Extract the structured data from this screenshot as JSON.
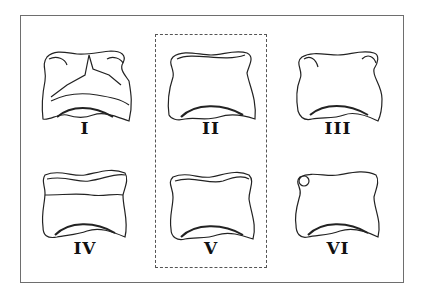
{
  "figure": {
    "frame_color": "#6e6e6e",
    "highlight_box": "dashed rectangle around column 2 (II and V)",
    "panels": [
      {
        "id": "I",
        "label": "I",
        "row": 1,
        "col": 1
      },
      {
        "id": "II",
        "label": "II",
        "row": 1,
        "col": 2
      },
      {
        "id": "III",
        "label": "III",
        "row": 1,
        "col": 3
      },
      {
        "id": "IV",
        "label": "IV",
        "row": 2,
        "col": 1
      },
      {
        "id": "V",
        "label": "V",
        "row": 2,
        "col": 2
      },
      {
        "id": "VI",
        "label": "VI",
        "row": 2,
        "col": 3
      }
    ]
  }
}
